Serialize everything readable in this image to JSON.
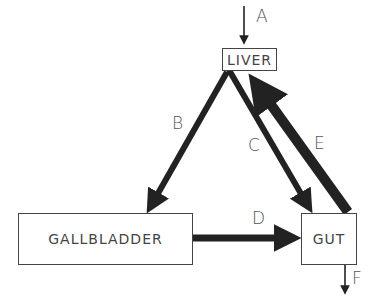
{
  "diagram": {
    "nodes": [
      {
        "id": "liver",
        "label": "LIVER"
      },
      {
        "id": "gallbladder",
        "label": "GALLBLADDER"
      },
      {
        "id": "gut",
        "label": "GUT"
      }
    ],
    "edges": [
      {
        "id": "A",
        "label": "A",
        "from": "external",
        "to": "liver",
        "weight": "thin"
      },
      {
        "id": "B",
        "label": "B",
        "from": "liver",
        "to": "gallbladder",
        "weight": "medium"
      },
      {
        "id": "C",
        "label": "C",
        "from": "liver",
        "to": "gut",
        "weight": "medium"
      },
      {
        "id": "D",
        "label": "D",
        "from": "gallbladder",
        "to": "gut",
        "weight": "medium"
      },
      {
        "id": "E",
        "label": "E",
        "from": "gut",
        "to": "liver",
        "weight": "thick"
      },
      {
        "id": "F",
        "label": "F",
        "from": "gut",
        "to": "external",
        "weight": "thin"
      }
    ],
    "colors": {
      "line": "#222222",
      "text": "#444444",
      "background": "#ffffff"
    }
  }
}
